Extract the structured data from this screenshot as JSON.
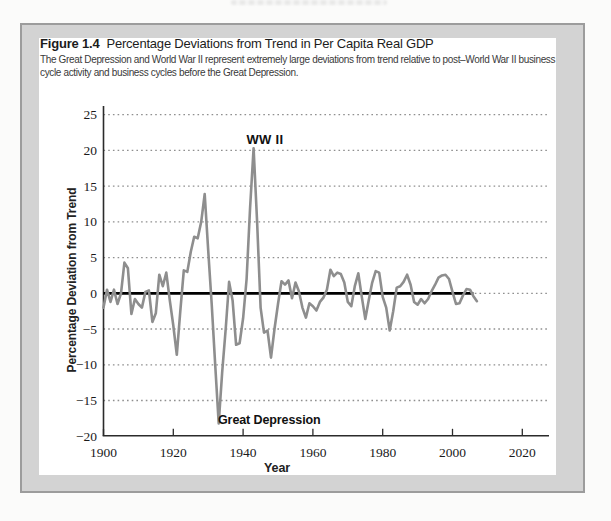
{
  "figure": {
    "label": "Figure 1.4",
    "title": "Percentage Deviations from Trend in Per Capita Real GDP",
    "caption": "The Great Depression and World War II represent extremely large deviations from trend relative to post–World War II business cycle activity and business cycles before the Great Depression."
  },
  "chart_data": {
    "type": "line",
    "xlabel": "Year",
    "ylabel": "Percentage Deviation from Trend",
    "xlim": [
      1900,
      2027
    ],
    "ylim": [
      -20,
      25
    ],
    "x_ticks": [
      1900,
      1920,
      1940,
      1960,
      1980,
      2000,
      2020
    ],
    "y_ticks": [
      25,
      20,
      15,
      10,
      5,
      0,
      -5,
      -10,
      -15,
      -20
    ],
    "grid": "horizontal-dotted",
    "legend": "none",
    "zero_line": {
      "from": 1900,
      "to": 2006
    },
    "annotations": [
      {
        "text": "WW II",
        "year": 1943,
        "value": 21.3
      },
      {
        "text": "Great Depression",
        "year": 1934,
        "value": -16.8
      }
    ],
    "series": [
      {
        "name": "Percentage deviation from trend in per capita real GDP",
        "color": "#8e8e8e",
        "x": [
          1900,
          1901,
          1902,
          1903,
          1904,
          1905,
          1906,
          1907,
          1908,
          1909,
          1910,
          1911,
          1912,
          1913,
          1914,
          1915,
          1916,
          1917,
          1918,
          1919,
          1920,
          1921,
          1922,
          1923,
          1924,
          1925,
          1926,
          1927,
          1928,
          1929,
          1930,
          1931,
          1932,
          1933,
          1934,
          1935,
          1936,
          1937,
          1938,
          1939,
          1940,
          1941,
          1942,
          1943,
          1944,
          1945,
          1946,
          1947,
          1948,
          1949,
          1950,
          1951,
          1952,
          1953,
          1954,
          1955,
          1956,
          1957,
          1958,
          1959,
          1960,
          1961,
          1962,
          1963,
          1964,
          1965,
          1966,
          1967,
          1968,
          1969,
          1970,
          1971,
          1972,
          1973,
          1974,
          1975,
          1976,
          1977,
          1978,
          1979,
          1980,
          1981,
          1982,
          1983,
          1984,
          1985,
          1986,
          1987,
          1988,
          1989,
          1990,
          1991,
          1992,
          1993,
          1994,
          1995,
          1996,
          1997,
          1998,
          1999,
          2000,
          2001,
          2002,
          2003,
          2004,
          2005,
          2006,
          2007
        ],
        "y": [
          -2.0,
          0.5,
          -1.2,
          0.5,
          -1.5,
          0.0,
          4.3,
          3.5,
          -2.9,
          -0.8,
          -1.5,
          -2.0,
          0.2,
          0.4,
          -4.0,
          -2.8,
          2.6,
          1.0,
          2.9,
          -1.0,
          -4.5,
          -8.6,
          -2.5,
          3.2,
          3.0,
          5.8,
          7.9,
          7.7,
          10.0,
          13.9,
          6.0,
          -1.5,
          -10.0,
          -18.2,
          -11.0,
          -5.0,
          1.6,
          -1.0,
          -7.2,
          -7.0,
          -3.5,
          2.0,
          12.0,
          20.3,
          10.0,
          -2.0,
          -5.5,
          -5.2,
          -9.0,
          -5.0,
          -1.5,
          1.7,
          1.2,
          1.8,
          -0.7,
          1.5,
          0.3,
          -2.0,
          -3.4,
          -1.4,
          -1.8,
          -2.4,
          -1.2,
          -0.6,
          0.5,
          3.3,
          2.4,
          2.9,
          2.7,
          1.5,
          -1.2,
          -1.8,
          1.0,
          2.8,
          -0.5,
          -3.6,
          -1.0,
          1.5,
          3.1,
          2.9,
          -0.5,
          -2.0,
          -5.2,
          -2.5,
          0.8,
          1.0,
          1.6,
          2.6,
          1.2,
          -1.2,
          -1.6,
          -0.8,
          -1.4,
          -0.8,
          0.3,
          1.2,
          2.2,
          2.5,
          2.6,
          2.0,
          0.2,
          -1.5,
          -1.4,
          -0.3,
          0.6,
          0.5,
          -0.4,
          -1.1
        ]
      }
    ]
  },
  "colors": {
    "card_frame": "#d3d3d3",
    "card_edge": "#9c9c9c",
    "grid": "#8f8f8f",
    "axis": "#2b2b2b",
    "zero_line": "#000000",
    "curve": "#8e8e8e",
    "tick_text": "#1a1a1a"
  }
}
